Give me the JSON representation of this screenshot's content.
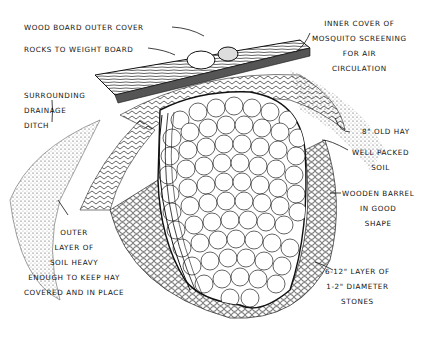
{
  "diagram": {
    "labels": {
      "wood_board": "WOOD BOARD OUTER COVER",
      "rocks": "ROCKS TO WEIGHT BOARD",
      "inner_cover": [
        "INNER COVER OF",
        "MOSQUITO SCREENING",
        "FOR AIR",
        "CIRCULATION"
      ],
      "drainage": [
        "SURROUNDING",
        "DRAINAGE",
        "DITCH"
      ],
      "old_hay": "8\" OLD HAY",
      "packed_soil": [
        "WELL PACKED",
        "SOIL"
      ],
      "barrel": [
        "WOODEN BARREL",
        "IN GOOD",
        "SHAPE"
      ],
      "outer_soil": [
        "OUTER",
        "LAYER OF",
        "SOIL HEAVY",
        "ENOUGH TO KEEP HAY",
        "COVERED AND IN PLACE"
      ],
      "stones": [
        "6-12\" LAYER OF",
        "1-2\" DIAMETER",
        "STONES"
      ]
    },
    "colors": {
      "ink": "#111111",
      "paper": "#ffffff"
    }
  }
}
